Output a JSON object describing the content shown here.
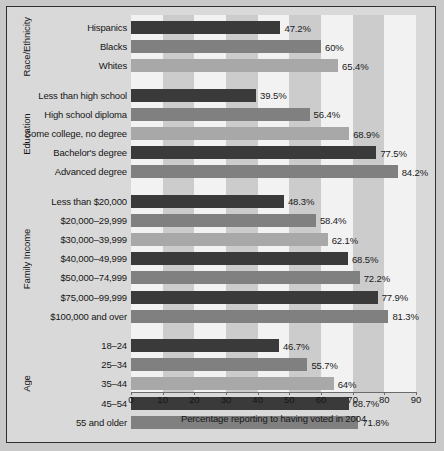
{
  "chart_data": {
    "type": "bar",
    "orientation": "horizontal",
    "title": "",
    "xlabel": "Percentage reporting to having voted in 2004",
    "ylabel": "",
    "xlim": [
      0,
      90
    ],
    "xticks": [
      0,
      10,
      20,
      30,
      40,
      50,
      60,
      70,
      80,
      90
    ],
    "grid": false,
    "legend": null,
    "value_suffix": "%",
    "colors": {
      "dark": "#3a3a3a",
      "medium": "#808080",
      "light": "#a8a8a8",
      "band_shade": "#cccccc",
      "band_plain": "#f2f2f2",
      "figure_background": "#d9d9d9",
      "border": "#2f2f2f",
      "text": "#161616"
    },
    "groups": [
      {
        "name": "Race/Ethnicity",
        "categories": [
          "Hispanics",
          "Blacks",
          "Whites"
        ],
        "values": [
          47.2,
          60,
          65.4
        ],
        "labels": [
          "47.2%",
          "60%",
          "65.4%"
        ],
        "shades": [
          "dark",
          "medium",
          "light"
        ]
      },
      {
        "name": "Education",
        "categories": [
          "Less than high school",
          "High school diploma",
          "Some college, no degree",
          "Bachelor's degree",
          "Advanced degree"
        ],
        "values": [
          39.5,
          56.4,
          68.9,
          77.5,
          84.2
        ],
        "labels": [
          "39.5%",
          "56.4%",
          "68.9%",
          "77.5%",
          "84.2%"
        ],
        "shades": [
          "dark",
          "medium",
          "light",
          "dark",
          "medium"
        ]
      },
      {
        "name": "Family Income",
        "categories": [
          "Less than $20,000",
          "$20,000–29,999",
          "$30,000–39,999",
          "$40,000–49,999",
          "$50,000–74,999",
          "$75,000–99,999",
          "$100,000 and over"
        ],
        "values": [
          48.3,
          58.4,
          62.1,
          68.5,
          72.2,
          77.9,
          81.3
        ],
        "labels": [
          "48.3%",
          "58.4%",
          "62.1%",
          "68.5%",
          "72.2%",
          "77.9%",
          "81.3%"
        ],
        "shades": [
          "dark",
          "medium",
          "light",
          "dark",
          "medium",
          "dark",
          "medium"
        ]
      },
      {
        "name": "Age",
        "categories": [
          "18–24",
          "25–34",
          "35–44",
          "45–54",
          "55 and older"
        ],
        "values": [
          46.7,
          55.7,
          64,
          68.7,
          71.8
        ],
        "labels": [
          "46.7%",
          "55.7%",
          "64%",
          "68.7%",
          "71.8%"
        ],
        "shades": [
          "dark",
          "medium",
          "light",
          "dark",
          "medium"
        ]
      }
    ]
  }
}
